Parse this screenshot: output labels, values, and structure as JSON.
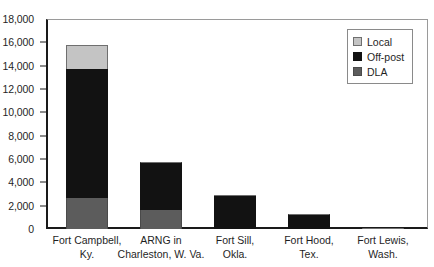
{
  "chart_data": {
    "type": "bar",
    "stacked": true,
    "title": "",
    "subtitle": "",
    "xlabel": "",
    "ylabel": "",
    "ylim": [
      0,
      18000
    ],
    "ytick_labels": [
      "18,000",
      "16,000",
      "14,000",
      "12,000",
      "10,000",
      "8,000",
      "6,000",
      "4,000",
      "2,000",
      "0"
    ],
    "ytick_values": [
      18000,
      16000,
      14000,
      12000,
      10000,
      8000,
      6000,
      4000,
      2000,
      0
    ],
    "grid": false,
    "legend_position": "top-right",
    "categories": [
      "Fort Campbell, Ky.",
      "ARNG in Charleston, W. Va.",
      "Fort Sill, Okla.",
      "Fort Hood, Tex.",
      "Fort Lewis, Wash."
    ],
    "category_lines": [
      [
        "Fort Campbell,",
        "Ky."
      ],
      [
        "ARNG in",
        "Charleston, W. Va."
      ],
      [
        "Fort Sill,",
        "Okla."
      ],
      [
        "Fort Hood,",
        "Tex."
      ],
      [
        "Fort Lewis,",
        "Wash."
      ]
    ],
    "series": [
      {
        "name": "DLA",
        "color": "#5c5c5c",
        "values": [
          2700,
          1600,
          0,
          0,
          100
        ]
      },
      {
        "name": "Off-post",
        "color": "#121212",
        "values": [
          11000,
          4150,
          2800,
          1250,
          0
        ]
      },
      {
        "name": "Local",
        "color": "#c4c4c4",
        "values": [
          2100,
          0,
          150,
          0,
          0
        ]
      }
    ],
    "totals": [
      15800,
      5750,
      2950,
      1250,
      100
    ],
    "stack_order_bottom_to_top": [
      "DLA",
      "Off-post",
      "Local"
    ]
  },
  "legend": {
    "items": [
      {
        "label": "Local",
        "swatch": "legend-swatch-local"
      },
      {
        "label": "Off-post",
        "swatch": "legend-swatch-off-post"
      },
      {
        "label": "DLA",
        "swatch": "legend-swatch-dla"
      }
    ]
  },
  "colors": {
    "local": "#c4c4c4",
    "off_post": "#121212",
    "dla": "#5c5c5c",
    "axis": "#1a1a1a",
    "text": "#1f1f1f",
    "background": "#ffffff"
  }
}
